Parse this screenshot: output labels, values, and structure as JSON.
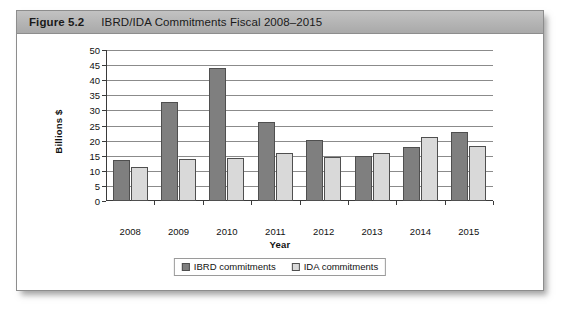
{
  "figure": {
    "number_label": "Figure 5.2",
    "caption": "IBRD/IDA Commitments Fiscal 2008–2015"
  },
  "legend": {
    "position": "bottom-center",
    "items": [
      {
        "label": "IBRD commitments",
        "color": "#7f7f7f",
        "swatch_name": "legend-swatch-ibrd"
      },
      {
        "label": "IDA commitments",
        "color": "#d9d9d9",
        "swatch_name": "legend-swatch-ida"
      }
    ]
  },
  "colors": {
    "ibrd": "#7f7f7f",
    "ida": "#d9d9d9",
    "bar_outline": "#4f4f4f",
    "gridline": "#8b8b8b",
    "axis": "#3a3a3a",
    "caption_bar": "#b4b4b4",
    "figure_border": "#8d8d8d",
    "background": "#ffffff"
  },
  "chart_data": {
    "type": "bar",
    "title": "IBRD/IDA Commitments Fiscal 2008–2015",
    "xlabel": "Year",
    "ylabel": "Billions $",
    "categories": [
      "2008",
      "2009",
      "2010",
      "2011",
      "2012",
      "2013",
      "2014",
      "2015"
    ],
    "series": [
      {
        "name": "IBRD commitments",
        "color": "#7f7f7f",
        "values": [
          13.5,
          32.9,
          44.2,
          26.2,
          20.2,
          14.8,
          18.0,
          22.7
        ]
      },
      {
        "name": "IDA commitments",
        "color": "#d9d9d9",
        "values": [
          11.2,
          14.0,
          14.3,
          16.0,
          14.5,
          15.8,
          21.3,
          18.2
        ]
      }
    ],
    "ylim": [
      0,
      50
    ],
    "ytick_step": 5,
    "yticks": [
      0,
      5,
      10,
      15,
      20,
      25,
      30,
      35,
      40,
      45,
      50
    ],
    "grid": true,
    "grid_axis": "y",
    "legend_position": "bottom-center"
  }
}
